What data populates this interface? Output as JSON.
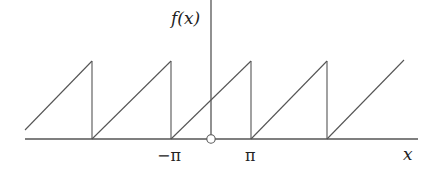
{
  "diagram": {
    "y_axis_label": "f(x)",
    "x_axis_label": "x",
    "tick_labels": [
      "−π",
      "π"
    ],
    "line_color": "#555555",
    "open_point_at": "origin",
    "teeth": [
      {
        "x1": 25,
        "y1": 130,
        "x2": 92,
        "y2": 61
      },
      {
        "x1": 92,
        "y1": 139,
        "x2": 171,
        "y2": 61
      },
      {
        "x1": 171,
        "y1": 139,
        "x2": 251,
        "y2": 61
      },
      {
        "x1": 251,
        "y1": 139,
        "x2": 327,
        "y2": 61
      },
      {
        "x1": 327,
        "y1": 139,
        "x2": 404,
        "y2": 60
      }
    ],
    "drops": [
      92,
      171,
      251,
      327
    ]
  }
}
